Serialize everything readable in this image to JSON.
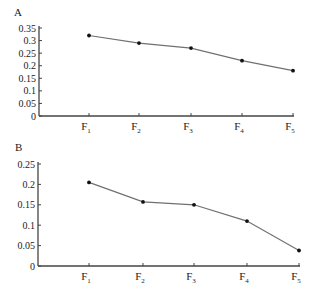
{
  "chart_data": [
    {
      "panel": "A",
      "type": "line",
      "title": "",
      "xlabel": "",
      "ylabel": "",
      "categories": [
        "F1",
        "F2",
        "F3",
        "F4",
        "F5"
      ],
      "category_display": [
        {
          "base": "F",
          "sub": "1"
        },
        {
          "base": "F",
          "sub": "2"
        },
        {
          "base": "F",
          "sub": "3"
        },
        {
          "base": "F",
          "sub": "4"
        },
        {
          "base": "F",
          "sub": "5"
        }
      ],
      "values": [
        0.32,
        0.29,
        0.27,
        0.22,
        0.18
      ],
      "ylim": [
        0,
        0.35
      ],
      "yticks": [
        0,
        0.05,
        0.1,
        0.15,
        0.2,
        0.25,
        0.3,
        0.35
      ],
      "ytick_labels": [
        "0",
        "0.05",
        "0.1",
        "0.15",
        "0.2",
        "0.25",
        "0.3",
        "0.35"
      ],
      "grid": false,
      "legend": null,
      "line_color": "#707070",
      "marker_color": "#111111"
    },
    {
      "panel": "B",
      "type": "line",
      "title": "",
      "xlabel": "",
      "ylabel": "",
      "categories": [
        "F1",
        "F2",
        "F3",
        "F4",
        "F5"
      ],
      "category_display": [
        {
          "base": "F",
          "sub": "1"
        },
        {
          "base": "F",
          "sub": "2"
        },
        {
          "base": "F",
          "sub": "3"
        },
        {
          "base": "F",
          "sub": "4"
        },
        {
          "base": "F",
          "sub": "5"
        }
      ],
      "values": [
        0.205,
        0.157,
        0.15,
        0.11,
        0.038
      ],
      "ylim": [
        0,
        0.25
      ],
      "yticks": [
        0,
        0.05,
        0.1,
        0.15,
        0.2,
        0.25
      ],
      "ytick_labels": [
        "0",
        "0.05",
        "0.1",
        "0.15",
        "0.2",
        "0.25"
      ],
      "grid": false,
      "legend": null,
      "line_color": "#707070",
      "marker_color": "#111111"
    }
  ],
  "panels": {
    "a_label": "A",
    "b_label": "B"
  }
}
